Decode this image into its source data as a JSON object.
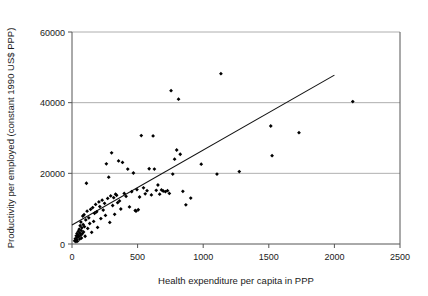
{
  "chart_data": {
    "type": "scatter",
    "title": "",
    "xlabel": "Health expenditure per capita in PPP",
    "ylabel": "Productivity per employed (constant 1990 US$ PPP)",
    "xlim": [
      0,
      2500
    ],
    "ylim": [
      0,
      60000
    ],
    "xticks": [
      0,
      500,
      1000,
      1500,
      2000,
      2500
    ],
    "yticks": [
      0,
      20000,
      40000,
      60000
    ],
    "xtick_labels": [
      "0",
      "500",
      "1000",
      "1500",
      "2000",
      "2500"
    ],
    "ytick_labels": [
      "0",
      "20000",
      "40000",
      "60000"
    ],
    "grid": "horizontal",
    "legend": "none",
    "marker_color": "#000000",
    "marker_shape": "diamond",
    "gridline_color": "#9a9a9a",
    "axis_color": "#555555",
    "trendline_color": "#111111",
    "series": [
      {
        "name": "Countries",
        "points": [
          [
            20,
            900
          ],
          [
            25,
            1500
          ],
          [
            30,
            700
          ],
          [
            32,
            2300
          ],
          [
            35,
            1200
          ],
          [
            38,
            3000
          ],
          [
            40,
            1900
          ],
          [
            42,
            800
          ],
          [
            45,
            2600
          ],
          [
            48,
            3600
          ],
          [
            52,
            2100
          ],
          [
            55,
            4200
          ],
          [
            58,
            1400
          ],
          [
            60,
            3100
          ],
          [
            62,
            5200
          ],
          [
            65,
            2500
          ],
          [
            68,
            6200
          ],
          [
            70,
            3800
          ],
          [
            72,
            1700
          ],
          [
            75,
            4600
          ],
          [
            78,
            2900
          ],
          [
            82,
            7900
          ],
          [
            85,
            5500
          ],
          [
            88,
            3400
          ],
          [
            92,
            8300
          ],
          [
            95,
            4900
          ],
          [
            100,
            2200
          ],
          [
            105,
            6800
          ],
          [
            110,
            17200
          ],
          [
            115,
            9300
          ],
          [
            120,
            4400
          ],
          [
            128,
            7400
          ],
          [
            135,
            5800
          ],
          [
            142,
            9800
          ],
          [
            150,
            3300
          ],
          [
            158,
            10300
          ],
          [
            165,
            6400
          ],
          [
            172,
            8700
          ],
          [
            180,
            11200
          ],
          [
            188,
            9100
          ],
          [
            195,
            4700
          ],
          [
            205,
            11900
          ],
          [
            212,
            10600
          ],
          [
            220,
            7200
          ],
          [
            230,
            12400
          ],
          [
            238,
            9600
          ],
          [
            248,
            11500
          ],
          [
            255,
            8100
          ],
          [
            262,
            22700
          ],
          [
            272,
            12900
          ],
          [
            280,
            18900
          ],
          [
            288,
            6100
          ],
          [
            295,
            13600
          ],
          [
            302,
            25800
          ],
          [
            310,
            10900
          ],
          [
            318,
            13100
          ],
          [
            325,
            8400
          ],
          [
            332,
            14100
          ],
          [
            340,
            13800
          ],
          [
            348,
            11700
          ],
          [
            355,
            23500
          ],
          [
            362,
            12200
          ],
          [
            372,
            9900
          ],
          [
            385,
            23100
          ],
          [
            398,
            14300
          ],
          [
            412,
            13500
          ],
          [
            425,
            21200
          ],
          [
            438,
            10500
          ],
          [
            455,
            14800
          ],
          [
            468,
            20100
          ],
          [
            482,
            9500
          ],
          [
            488,
            9300
          ],
          [
            495,
            15400
          ],
          [
            505,
            9700
          ],
          [
            515,
            13300
          ],
          [
            528,
            30700
          ],
          [
            545,
            15900
          ],
          [
            558,
            14200
          ],
          [
            572,
            15100
          ],
          [
            588,
            21300
          ],
          [
            605,
            13900
          ],
          [
            618,
            30600
          ],
          [
            628,
            21200
          ],
          [
            642,
            15200
          ],
          [
            655,
            16700
          ],
          [
            668,
            14100
          ],
          [
            682,
            15300
          ],
          [
            695,
            15000
          ],
          [
            712,
            14800
          ],
          [
            728,
            15100
          ],
          [
            742,
            14300
          ],
          [
            755,
            43400
          ],
          [
            768,
            19800
          ],
          [
            782,
            24000
          ],
          [
            798,
            26600
          ],
          [
            812,
            41000
          ],
          [
            825,
            25400
          ],
          [
            845,
            14900
          ],
          [
            868,
            11100
          ],
          [
            905,
            13000
          ],
          [
            985,
            22600
          ],
          [
            1105,
            19800
          ],
          [
            1135,
            48200
          ],
          [
            1275,
            20500
          ],
          [
            1515,
            33400
          ],
          [
            1525,
            25000
          ],
          [
            1730,
            31500
          ],
          [
            2140,
            40300
          ]
        ]
      }
    ],
    "trendline": {
      "x_start": 0,
      "y_start": 5400,
      "x_end": 2000,
      "y_end": 47800
    }
  }
}
